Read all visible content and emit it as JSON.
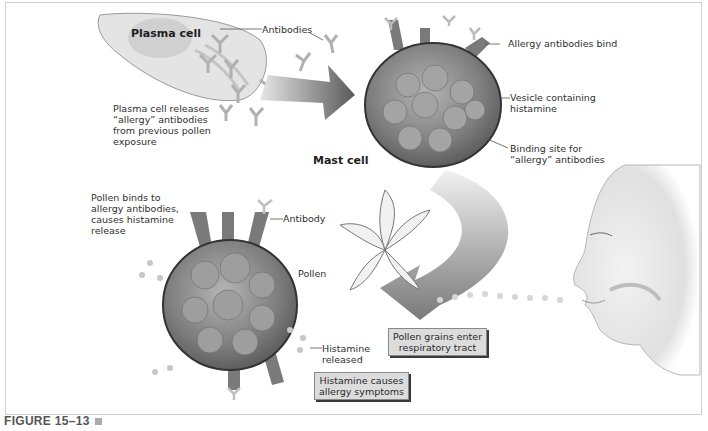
{
  "labels": {
    "plasma_cell": "Plasma cell",
    "antibodies": "Antibodies",
    "plasma_release": "Plasma cell releases\n“allergy” antibodies\nfrom previous pollen\nexposure",
    "mast_cell": "Mast cell",
    "allergy_bind": "Allergy antibodies bind",
    "vesicle": "Vesicle containing\nhistamine",
    "binding_site": "Binding site for\n“allergy” antibodies",
    "pollen_binds": "Pollen binds to\nallergy antibodies,\ncauses histamine\nrelease",
    "antibody": "Antibody",
    "pollen": "Pollen",
    "histamine_released": "Histamine\nreleased"
  },
  "boxes": {
    "pollen_enter": "Pollen grains enter\nrespiratory tract",
    "histamine_causes": "Histamine causes\nallergy symptoms"
  },
  "caption": {
    "figure": "FIGURE 15–13"
  },
  "colors": {
    "cell_fill": "#8a8a8a",
    "arrow": "#6e6e6e",
    "text": "#2f2f2f",
    "box_fill": "#dcdcdc"
  }
}
